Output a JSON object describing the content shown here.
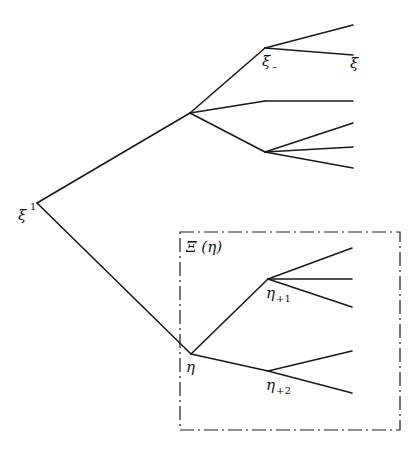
{
  "diagram": {
    "type": "tree",
    "nodes": [
      {
        "id": "xi1",
        "label": "ξ",
        "sup": "1",
        "x": 37,
        "y": 203
      },
      {
        "id": "a",
        "label": "",
        "x": 190,
        "y": 113
      },
      {
        "id": "xi_minus",
        "label": "ξ",
        "sub": "–",
        "x": 265,
        "y": 48
      },
      {
        "id": "xi",
        "label": "ξ",
        "x": 353,
        "y": 55
      },
      {
        "id": "b",
        "label": "",
        "x": 265,
        "y": 152
      },
      {
        "id": "eta",
        "label": "η",
        "x": 191,
        "y": 354
      },
      {
        "id": "eta1",
        "label": "η",
        "sub": "+1",
        "x": 268,
        "y": 279
      },
      {
        "id": "eta2",
        "label": "η",
        "sub": "+2",
        "x": 268,
        "y": 371
      }
    ],
    "edges": [
      [
        37,
        203,
        190,
        113
      ],
      [
        37,
        203,
        191,
        354
      ],
      [
        190,
        113,
        265,
        48
      ],
      [
        190,
        113,
        265,
        101
      ],
      [
        190,
        113,
        265,
        152
      ],
      [
        265,
        48,
        353,
        25
      ],
      [
        265,
        48,
        353,
        55
      ],
      [
        265,
        101,
        353,
        101
      ],
      [
        265,
        152,
        353,
        123
      ],
      [
        265,
        152,
        353,
        147
      ],
      [
        265,
        152,
        353,
        168
      ],
      [
        191,
        354,
        268,
        279
      ],
      [
        191,
        354,
        268,
        371
      ],
      [
        268,
        279,
        352,
        248
      ],
      [
        268,
        279,
        352,
        279
      ],
      [
        268,
        279,
        352,
        307
      ],
      [
        268,
        371,
        352,
        351
      ],
      [
        268,
        371,
        352,
        393
      ]
    ],
    "box": {
      "label": "Ξ (η)",
      "x": 180,
      "y": 232,
      "w": 220,
      "h": 198
    }
  },
  "labels": {
    "root": "ξ",
    "root_sup": "1",
    "xi_minus": "ξ",
    "xi_minus_sub": "–",
    "xi": "ξ",
    "box_title": "Ξ (η)",
    "eta": "η",
    "eta1": "η",
    "eta1_sub": "+1",
    "eta2": "η",
    "eta2_sub": "+2"
  }
}
